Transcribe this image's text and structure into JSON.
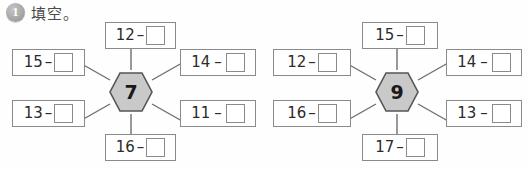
{
  "header": {
    "number": "1",
    "title": "填空。"
  },
  "operator": "–",
  "answer_placeholder": "",
  "colors": {
    "hex_fill": "#c9c9c9",
    "hex_stroke": "#555555",
    "card_border": "#8a8a8a",
    "spoke": "#6e6e6e",
    "text": "#2b2b2b",
    "badge": "#a8a8a8"
  },
  "wheels": [
    {
      "id": "wheel-left",
      "center": "7",
      "cards": [
        {
          "position": "top",
          "minuend": "12",
          "answer": ""
        },
        {
          "position": "upper-left",
          "minuend": "15",
          "answer": ""
        },
        {
          "position": "lower-left",
          "minuend": "13",
          "answer": ""
        },
        {
          "position": "bottom",
          "minuend": "16",
          "answer": ""
        },
        {
          "position": "upper-right",
          "minuend": "14",
          "answer": ""
        },
        {
          "position": "lower-right",
          "minuend": "11",
          "answer": ""
        }
      ]
    },
    {
      "id": "wheel-right",
      "center": "9",
      "cards": [
        {
          "position": "top",
          "minuend": "15",
          "answer": ""
        },
        {
          "position": "upper-left",
          "minuend": "12",
          "answer": ""
        },
        {
          "position": "lower-left",
          "minuend": "16",
          "answer": ""
        },
        {
          "position": "bottom",
          "minuend": "17",
          "answer": ""
        },
        {
          "position": "upper-right",
          "minuend": "14",
          "answer": ""
        },
        {
          "position": "lower-right",
          "minuend": "13",
          "answer": ""
        }
      ]
    }
  ]
}
